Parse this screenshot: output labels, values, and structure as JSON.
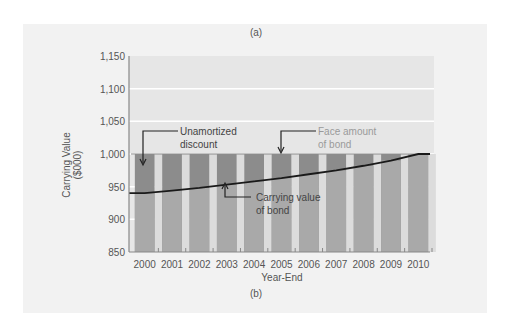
{
  "figure": {
    "caption_top": "(a)",
    "caption_bottom": "(b)",
    "colors": {
      "panel_bg": "#f2f2f2",
      "plot_bg": "#e6e6e6",
      "gridline": "#ffffff",
      "carrying_bar": "#a9a9a9",
      "discount_bar": "#8c8c8c",
      "gap": "#dcdcdc",
      "line": "#1a1a1a",
      "annotation_text_dark": "#444444",
      "annotation_text_light": "#9a9a9a"
    }
  },
  "chart_data": {
    "type": "bar",
    "title": "",
    "xlabel": "Year-End",
    "ylabel": "Carrying Value ($000)",
    "ylabel_line1": "Carrying Value",
    "ylabel_line2": "($000)",
    "ylim": [
      850,
      1150
    ],
    "yticks": [
      "850",
      "900",
      "950",
      "1,000",
      "1,050",
      "1,100",
      "1,150"
    ],
    "grid": true,
    "categories": [
      "2000",
      "2001",
      "2002",
      "2003",
      "2004",
      "2005",
      "2006",
      "2007",
      "2008",
      "2009",
      "2010"
    ],
    "series": [
      {
        "name": "Face amount of bond",
        "type": "bar",
        "values": [
          1000,
          1000,
          1000,
          1000,
          1000,
          1000,
          1000,
          1000,
          1000,
          1000,
          1000
        ]
      },
      {
        "name": "Carrying value of bond",
        "type": "line",
        "values": [
          940,
          944,
          948,
          953,
          958,
          963,
          969,
          975,
          982,
          990,
          1000
        ]
      }
    ],
    "annotations": [
      {
        "label_line1": "Unamortized",
        "label_line2": "discount"
      },
      {
        "label_line1": "Face amount",
        "label_line2": "of bond"
      },
      {
        "label_line1": "Carrying value",
        "label_line2": "of bond"
      }
    ]
  }
}
